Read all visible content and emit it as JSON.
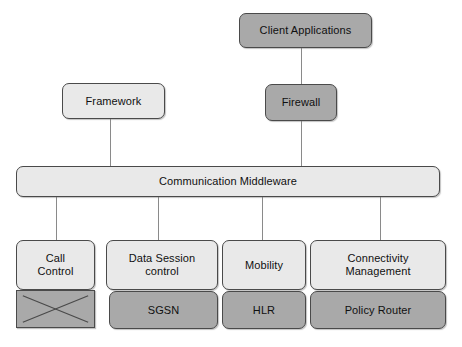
{
  "diagram": {
    "background_color": "#ffffff",
    "colors": {
      "fill_light": "#e9e9e9",
      "fill_dark": "#a9a9a9",
      "stroke": "#4a4a4a",
      "connector": "#8a8a8a",
      "text": "#101010"
    },
    "nodes": [
      {
        "id": "client-applications",
        "label": "Client Applications",
        "shade": "dark",
        "x": 239,
        "y": 13,
        "w": 133,
        "h": 35
      },
      {
        "id": "framework",
        "label": "Framework",
        "shade": "light",
        "x": 62,
        "y": 83,
        "w": 103,
        "h": 36
      },
      {
        "id": "firewall",
        "label": "Firewall",
        "shade": "dark",
        "x": 265,
        "y": 84,
        "w": 72,
        "h": 37
      },
      {
        "id": "communication-middleware",
        "label": "Communication Middleware",
        "shade": "light",
        "x": 16,
        "y": 166,
        "w": 424,
        "h": 31
      },
      {
        "id": "call-control",
        "label": "Call\nControl",
        "shade": "light",
        "x": 16,
        "y": 240,
        "w": 79,
        "h": 50
      },
      {
        "id": "call-control-sub",
        "label": "",
        "shade": "dark",
        "shape": "square",
        "crossed": true,
        "x": 16,
        "y": 290,
        "w": 79,
        "h": 38
      },
      {
        "id": "data-session-control",
        "label": "Data Session\ncontrol",
        "shade": "light",
        "x": 106,
        "y": 240,
        "w": 112,
        "h": 50
      },
      {
        "id": "sgsn",
        "label": "SGSN",
        "shade": "dark",
        "x": 109,
        "y": 291,
        "w": 109,
        "h": 38
      },
      {
        "id": "mobility",
        "label": "Mobility",
        "shade": "light",
        "x": 222,
        "y": 240,
        "w": 84,
        "h": 50
      },
      {
        "id": "hlr",
        "label": "HLR",
        "shade": "dark",
        "x": 222,
        "y": 291,
        "w": 84,
        "h": 38
      },
      {
        "id": "connectivity-management",
        "label": "Connectivity\nManagement",
        "shade": "light",
        "x": 310,
        "y": 240,
        "w": 136,
        "h": 50
      },
      {
        "id": "policy-router",
        "label": "Policy Router",
        "shade": "dark",
        "x": 310,
        "y": 291,
        "w": 136,
        "h": 38
      }
    ],
    "connectors": [
      {
        "id": "client-applications-to-firewall",
        "x": 301,
        "y": 48,
        "h": 37
      },
      {
        "id": "framework-to-middleware",
        "x": 110,
        "y": 119,
        "h": 48
      },
      {
        "id": "firewall-to-middleware",
        "x": 301,
        "y": 121,
        "h": 46
      },
      {
        "id": "middleware-to-call-control",
        "x": 56,
        "y": 197,
        "h": 44
      },
      {
        "id": "middleware-to-data-session-control",
        "x": 158,
        "y": 197,
        "h": 44
      },
      {
        "id": "middleware-to-mobility",
        "x": 262,
        "y": 197,
        "h": 44
      },
      {
        "id": "middleware-to-connectivity-management",
        "x": 380,
        "y": 197,
        "h": 44
      }
    ]
  }
}
